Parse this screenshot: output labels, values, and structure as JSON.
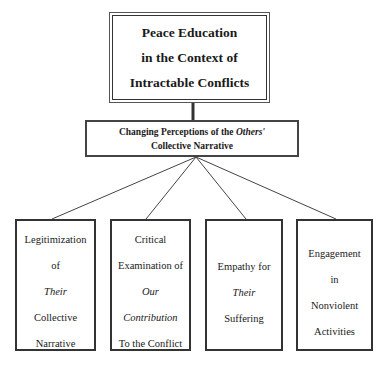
{
  "diagram": {
    "root": {
      "lines": [
        "Peace Education",
        "in the Context of",
        "Intractable Conflicts"
      ]
    },
    "middle": {
      "line1_pre": "Changing Perceptions of the ",
      "line1_italic": "Others'",
      "line2": "Collective Narrative"
    },
    "leaves": [
      {
        "lines": [
          {
            "text": "Legitimization",
            "italic": false
          },
          {
            "text": "of",
            "italic": false
          },
          {
            "text": "Their",
            "italic": true
          },
          {
            "text": "Collective",
            "italic": false
          },
          {
            "text": "Narrative",
            "italic": false
          }
        ]
      },
      {
        "lines": [
          {
            "text": "Critical",
            "italic": false
          },
          {
            "text": "Examination of",
            "italic": false
          },
          {
            "text": "Our",
            "italic": true
          },
          {
            "text": "Contribution",
            "italic": true
          },
          {
            "text": "To the Conflict",
            "italic": false
          }
        ]
      },
      {
        "lines": [
          {
            "text": "Empathy for",
            "italic": false
          },
          {
            "text": "Their",
            "italic": true
          },
          {
            "text": "Suffering",
            "italic": false
          }
        ]
      },
      {
        "lines": [
          {
            "text": "Engagement",
            "italic": false
          },
          {
            "text": "in",
            "italic": false
          },
          {
            "text": "Nonviolent",
            "italic": false
          },
          {
            "text": "Activities",
            "italic": false
          }
        ]
      }
    ],
    "colors": {
      "line": "#333333",
      "background": "#ffffff",
      "text": "#1a1a1a"
    }
  }
}
